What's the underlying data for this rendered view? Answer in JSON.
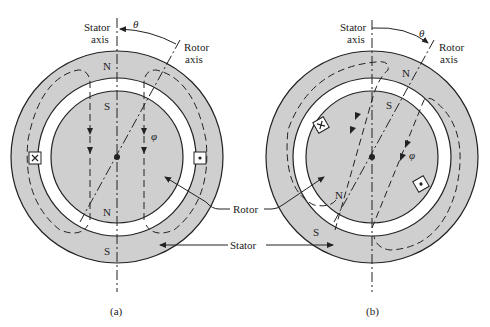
{
  "figure": {
    "type": "machine cross-section diagram",
    "colors": {
      "iron": "#cfcfcf",
      "airgap": "#ffffff",
      "line": "#222222"
    },
    "panels": [
      {
        "caption": "(a)",
        "stator_axis_label_1": "Stator",
        "stator_axis_label_2": "axis",
        "rotor_axis_label_1": "Rotor",
        "rotor_axis_label_2": "axis",
        "angle_label": "θ",
        "flux_label": "φ",
        "stator_top_pole": "N",
        "stator_bottom_pole": "S",
        "rotor_top_pole": "S",
        "rotor_bottom_pole": "N",
        "left_conductor": "cross",
        "right_conductor": "dot"
      },
      {
        "caption": "(b)",
        "stator_axis_label_1": "Stator",
        "stator_axis_label_2": "axis",
        "rotor_axis_label_1": "Rotor",
        "rotor_axis_label_2": "axis",
        "angle_label": "θ",
        "flux_label": "φ",
        "stator_top_pole": "N",
        "stator_bottom_pole": "S",
        "rotor_top_pole": "S",
        "rotor_bottom_pole": "N",
        "left_conductor": "cross",
        "right_conductor": "dot"
      }
    ],
    "callouts": {
      "rotor": "Rotor",
      "stator": "Stator"
    }
  }
}
